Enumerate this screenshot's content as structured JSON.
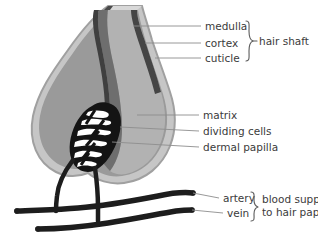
{
  "figure": {
    "background_color": "#ffffff",
    "colors": {
      "sheath_outer": "#a9a9a9",
      "sheath_inner": "#c9c9c9",
      "follicle_body": "#8f8f8f",
      "cortex": "#b0b0b0",
      "medulla": "#6e6e6e",
      "cuticle": "#4a4a4a",
      "matrix": "#9a9a9a",
      "papilla_dark": "#141414",
      "vessel": "#1d1d1d",
      "leader_line": "#8d8d8d",
      "text": "#3b3b3b"
    }
  },
  "labels": {
    "medulla": "medulla",
    "cortex": "cortex",
    "cuticle": "cuticle",
    "matrix": "matrix",
    "dividing_cells": "dividing cells",
    "dermal_papilla": "dermal papilla",
    "artery": "artery",
    "vein": "vein"
  },
  "groups": {
    "hair_shaft": "hair shaft",
    "blood_supply_line1": "blood supply",
    "blood_supply_line2": "to hair papilla"
  },
  "structures": {
    "outer_sheath": "outer-root-sheath",
    "hair_shaft_body": "hair-shaft",
    "medulla_band": "medulla-band",
    "cuticle_band": "cuticle-band",
    "bulb": "hair-bulb",
    "papilla_mesh": "dermal-papilla-mesh",
    "artery_vessel": "artery-vessel",
    "vein_vessel": "vein-vessel",
    "capillary_loop": "capillary-loop"
  }
}
